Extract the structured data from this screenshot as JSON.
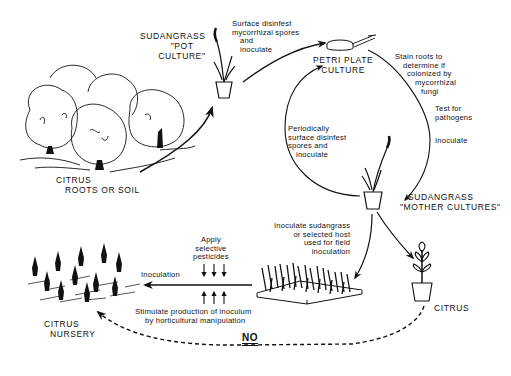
{
  "diagram": {
    "type": "process-cycle",
    "ink_color": "#111111",
    "background_color": "#ffffff",
    "nodes": {
      "citrus_source": {
        "label_line1": "CITRUS",
        "label_line2": "ROOTS OR SOIL"
      },
      "pot_culture": {
        "label_line1": "SUDANGRASS",
        "label_line2": "\"POT",
        "label_line3": "CULTURE\""
      },
      "petri_plate": {
        "label_line1": "PETRI PLATE",
        "label_line2": "CULTURE"
      },
      "mother_cultures": {
        "label_line1": "SUDANGRASS",
        "label_line2": "\"MOTHER CULTURES\""
      },
      "citrus_pot": {
        "label": "CITRUS"
      },
      "citrus_nursery": {
        "label_line1": "CITRUS",
        "label_line2": "NURSERY"
      }
    },
    "annotations": {
      "surface_disinfest": {
        "line1": "Surface disinfest",
        "line2": "mycorrhizal spores",
        "line3": "and",
        "line4": "inoculate"
      },
      "stain_roots": {
        "line1": "Stain roots to",
        "line2": "determine if",
        "line3": "colonized by",
        "line4": "mycorrhizal",
        "line5": "fungi"
      },
      "test_pathogens": {
        "line1": "Test for",
        "line2": "pathogens"
      },
      "inoculate": {
        "line1": "Inoculate"
      },
      "periodically": {
        "line1": "Periodically",
        "line2": "surface disinfest",
        "line3": "spores and",
        "line4": "inoculate"
      },
      "field_inoculation": {
        "line1": "Inoculate sudangrass",
        "line2": "or selected host",
        "line3": "used for field",
        "line4": "inoculation"
      },
      "apply_pesticides": {
        "line1": "Apply",
        "line2": "selective",
        "line3": "pesticides"
      },
      "inoculation": {
        "line1": "Inoculation"
      },
      "stimulate": {
        "line1": "Stimulate production of inoculum",
        "line2": "by horticultural manipulation"
      },
      "no": {
        "label": "NO"
      }
    },
    "edges": [
      {
        "from": "citrus_source",
        "to": "pot_culture",
        "style": "solid"
      },
      {
        "from": "pot_culture",
        "to": "petri_plate",
        "style": "solid"
      },
      {
        "from": "petri_plate",
        "to": "mother_cultures",
        "style": "solid"
      },
      {
        "from": "mother_cultures",
        "to": "petri_plate",
        "style": "solid"
      },
      {
        "from": "mother_cultures",
        "to": "field_flat",
        "style": "solid"
      },
      {
        "from": "mother_cultures",
        "to": "citrus_pot",
        "style": "solid"
      },
      {
        "from": "field_flat",
        "to": "citrus_nursery",
        "style": "solid"
      },
      {
        "from": "citrus_pot",
        "to": "citrus_nursery",
        "style": "dashed"
      }
    ]
  }
}
